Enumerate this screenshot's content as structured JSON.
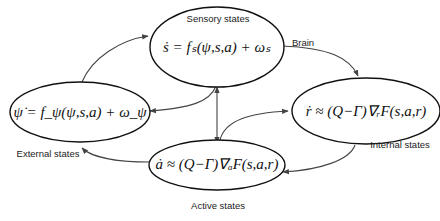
{
  "diagram": {
    "nodes": {
      "sensory": {
        "label": "Sensory states",
        "equation": "ṡ = fₛ(ψ,s,a) + ωₛ"
      },
      "external": {
        "label": "External states",
        "equation": "ψ̇ = f_ψ(ψ,s,a) + ω_ψ"
      },
      "internal": {
        "label": "Internal states",
        "equation": "ṙ ≈ (Q−Γ)∇ᵣF(s,a,r)"
      },
      "active": {
        "label": "Active states",
        "equation": "ȧ ≈ (Q−Γ)∇ₐF(s,a,r)"
      }
    },
    "region_label": "Brain",
    "edges": [
      {
        "from": "external",
        "to": "sensory"
      },
      {
        "from": "sensory",
        "to": "internal"
      },
      {
        "from": "sensory",
        "to": "external"
      },
      {
        "from": "sensory",
        "to": "active",
        "bidirectional": true
      },
      {
        "from": "active",
        "to": "internal"
      },
      {
        "from": "internal",
        "to": "active"
      },
      {
        "from": "active",
        "to": "external"
      }
    ]
  }
}
